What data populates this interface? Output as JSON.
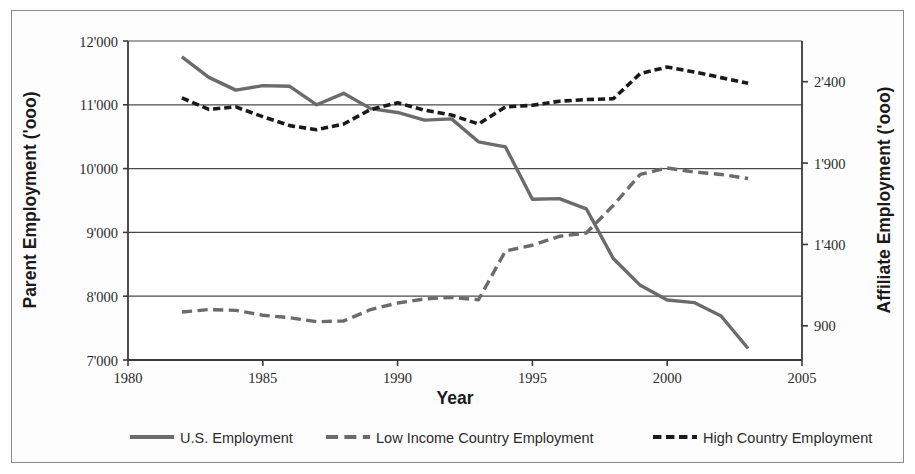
{
  "chart_data": {
    "type": "line",
    "title": "",
    "xlabel": "Year",
    "ylabel_left": "Parent Employment ('ooo)",
    "ylabel_right": "Affiliate Employment ('ooo)",
    "xlim": [
      1980,
      2005
    ],
    "xticks": [
      1980,
      1985,
      1990,
      1995,
      2000,
      2005
    ],
    "xtick_labels": [
      "1980",
      "1985",
      "1990",
      "1995",
      "2000",
      "2005"
    ],
    "ylim_left": [
      7000,
      12000
    ],
    "yticks_left": [
      7000,
      8000,
      9000,
      10000,
      11000,
      12000
    ],
    "ytick_labels_left": [
      "7'000",
      "8'000",
      "9'000",
      "10'000",
      "11'000",
      "12'000"
    ],
    "ylim_right": [
      690,
      2650
    ],
    "yticks_right": [
      900,
      1400,
      1900,
      2400
    ],
    "ytick_labels_right": [
      "900",
      "1'400",
      "1'900",
      "2'400"
    ],
    "grid": true,
    "legend_position": "bottom",
    "series": [
      {
        "name": "U.S. Employment",
        "axis": "left",
        "color": "#6b6b6b",
        "style": "solid",
        "width": 3.4,
        "x": [
          1982,
          1983,
          1984,
          1985,
          1986,
          1987,
          1988,
          1989,
          1990,
          1991,
          1992,
          1993,
          1994,
          1995,
          1996,
          1997,
          1998,
          1999,
          2000,
          2001,
          2002,
          2003
        ],
        "values": [
          11750,
          11430,
          11230,
          11300,
          11290,
          11000,
          11180,
          10940,
          10880,
          10760,
          10780,
          10420,
          10340,
          9520,
          9530,
          9370,
          8590,
          8170,
          7940,
          7900,
          7690,
          7180
        ]
      },
      {
        "name": "Low Income Country Employment",
        "axis": "right",
        "color": "#6b6b6b",
        "style": "dashed-long",
        "width": 3.4,
        "x": [
          1982,
          1983,
          1984,
          1985,
          1986,
          1987,
          1988,
          1989,
          1990,
          1991,
          1992,
          1993,
          1994,
          1995,
          1996,
          1997,
          1998,
          1999,
          2000,
          2001,
          2002,
          2003
        ],
        "values": [
          985,
          1000,
          995,
          965,
          950,
          925,
          930,
          1000,
          1040,
          1065,
          1075,
          1060,
          1360,
          1395,
          1450,
          1470,
          1640,
          1830,
          1870,
          1845,
          1830,
          1805
        ]
      },
      {
        "name": "High Country Employment",
        "axis": "right",
        "color": "#1a1a1a",
        "style": "dashed-short",
        "width": 3.6,
        "x": [
          1982,
          1983,
          1984,
          1985,
          1986,
          1987,
          1988,
          1989,
          1990,
          1991,
          1992,
          1993,
          1994,
          1995,
          1996,
          1997,
          1998,
          1999,
          2000,
          2001,
          2002,
          2003
        ],
        "values": [
          2300,
          2230,
          2245,
          2185,
          2130,
          2105,
          2140,
          2230,
          2270,
          2225,
          2195,
          2140,
          2245,
          2255,
          2280,
          2290,
          2295,
          2450,
          2490,
          2460,
          2425,
          2390
        ]
      }
    ]
  },
  "legend": {
    "items": [
      {
        "label": "U.S. Employment",
        "marker": "solid-line-marker"
      },
      {
        "label": "Low Income Country Employment",
        "marker": "long-dash-line-marker"
      },
      {
        "label": "High Country Employment",
        "marker": "short-dash-line-marker"
      }
    ]
  },
  "colors": {
    "solid_series": "#6b6b6b",
    "low_income_series": "#6b6b6b",
    "high_country_series": "#1a1a1a",
    "axis": "#3a3a3a",
    "grid": "#4a4a4a",
    "frame": "#8a8a8a",
    "text": "#2b2b2b"
  }
}
